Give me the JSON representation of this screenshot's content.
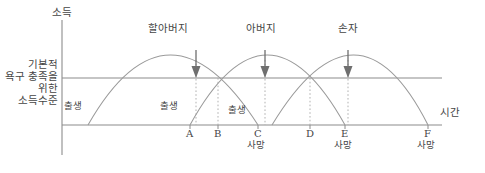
{
  "figure": {
    "type": "diagram",
    "axes": {
      "y_label": "소득",
      "x_label": "시간",
      "y_axis_x": 62,
      "baseline_y": 125,
      "needs_line_y": 78
    },
    "needs_label": {
      "line1": "기본적",
      "line2": "욕구 충족을",
      "line3": "위한",
      "line4": "소득수준"
    },
    "curves": [
      {
        "id": "grandfather",
        "title": "할아버지",
        "start_x": 88,
        "peak_x": 168,
        "peak_y": 37,
        "end_x": 258
      },
      {
        "id": "father",
        "title": "아버지",
        "start_x": 190,
        "peak_x": 265,
        "peak_y": 37,
        "end_x": 345
      },
      {
        "id": "grandson",
        "title": "손자",
        "start_x": 272,
        "peak_x": 358,
        "peak_y": 37,
        "end_x": 428
      }
    ],
    "birth_labels": [
      {
        "text": "출생",
        "x": 64,
        "y": 101
      },
      {
        "text": "출생",
        "x": 160,
        "y": 101
      },
      {
        "text": "출생",
        "x": 228,
        "y": 105
      }
    ],
    "ticks": [
      {
        "label": "A",
        "x": 190,
        "death": ""
      },
      {
        "label": "B",
        "x": 218,
        "death": ""
      },
      {
        "label": "C",
        "x": 258,
        "death": "사망"
      },
      {
        "label": "D",
        "x": 310,
        "death": ""
      },
      {
        "label": "E",
        "x": 345,
        "death": "사망"
      },
      {
        "label": "F",
        "x": 428,
        "death": "사망"
      }
    ],
    "arrows": [
      {
        "curve": "grandfather",
        "x": 196,
        "top": 52,
        "bottom": 76
      },
      {
        "curve": "father",
        "x": 265,
        "top": 52,
        "bottom": 76
      },
      {
        "curve": "grandson",
        "x": 348,
        "top": 52,
        "bottom": 76
      }
    ],
    "colors": {
      "line": "#8c8c8c",
      "text": "#454545",
      "background": "#ffffff"
    }
  }
}
